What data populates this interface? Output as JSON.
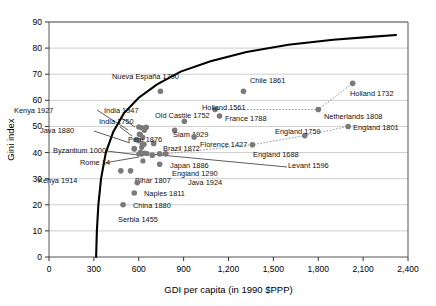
{
  "chart_data": {
    "type": "scatter",
    "title": "",
    "xlabel": "GDI per capita (in 1990 $PPP)",
    "ylabel": "Gini index",
    "xlim": [
      0,
      2400
    ],
    "ylim": [
      0,
      90
    ],
    "xticks": [
      0,
      300,
      600,
      900,
      1200,
      1500,
      1800,
      2100,
      2400
    ],
    "xtick_labels": [
      "0",
      "300",
      "600",
      "900",
      "1,200",
      "1,500",
      "1,800",
      "2,100",
      "2,400"
    ],
    "yticks": [
      0,
      10,
      20,
      30,
      40,
      50,
      60,
      70,
      80,
      90
    ],
    "ytick_labels": [
      "0",
      "10",
      "20",
      "30",
      "40",
      "50",
      "60",
      "70",
      "80",
      "90"
    ],
    "grid": "horizontal",
    "legend": "none",
    "marker_color": "#7a7a7a",
    "curve_color": "#000000",
    "connector_color": "#8a8a8a",
    "points": [
      {
        "name": "Nueva España 1790",
        "x": 745,
        "y": 63.5,
        "lx": 112,
        "ly": 79,
        "anchor": "start"
      },
      {
        "name": "Chile 1861",
        "x": 1300,
        "y": 63.5,
        "lx": 250,
        "ly": 83,
        "anchor": "start"
      },
      {
        "name": "Holland 1732",
        "x": 2030,
        "y": 66.5,
        "lx": 350,
        "ly": 96,
        "anchor": "start"
      },
      {
        "name": "Holland 1561",
        "x": 1110,
        "y": 56.5,
        "lx": 202,
        "ly": 110,
        "anchor": "start"
      },
      {
        "name": "France 1788",
        "x": 1140,
        "y": 54.0,
        "lx": 225,
        "ly": 121,
        "anchor": "start"
      },
      {
        "name": "Netherlands 1808",
        "x": 1800,
        "y": 56.5,
        "lx": 324,
        "ly": 119,
        "anchor": "start"
      },
      {
        "name": "Old Castile 1752",
        "x": 905,
        "y": 52.0,
        "lx": 155,
        "ly": 118,
        "anchor": "start"
      },
      {
        "name": "England 1801",
        "x": 2000,
        "y": 50.0,
        "lx": 353,
        "ly": 130,
        "anchor": "start"
      },
      {
        "name": "England 1759",
        "x": 1710,
        "y": 46.5,
        "lx": 275,
        "ly": 134,
        "anchor": "start"
      },
      {
        "name": "Siam 1929",
        "x": 840,
        "y": 48.5,
        "lx": 173,
        "ly": 137,
        "anchor": "start"
      },
      {
        "name": "Florence 1427",
        "x": 970,
        "y": 46.0,
        "lx": 200,
        "ly": 147,
        "anchor": "start"
      },
      {
        "name": "England 1688",
        "x": 1360,
        "y": 43.0,
        "lx": 253,
        "ly": 157,
        "anchor": "start"
      },
      {
        "name": "Brazil 1872",
        "x": 700,
        "y": 43.5,
        "lx": 163,
        "ly": 151,
        "anchor": "start"
      },
      {
        "name": "Japan 1886",
        "x": 780,
        "y": 39.5,
        "lx": 170,
        "ly": 168,
        "anchor": "start"
      },
      {
        "name": "England 1290",
        "x": 740,
        "y": 39.5,
        "lx": 172,
        "ly": 176,
        "anchor": "start"
      },
      {
        "name": "Levant 1596",
        "x": 690,
        "y": 39.0,
        "lx": 288,
        "ly": 168,
        "anchor": "start"
      },
      {
        "name": "Java 1924",
        "x": 740,
        "y": 35.5,
        "lx": 188,
        "ly": 185,
        "anchor": "start"
      },
      {
        "name": "Bihar 1807",
        "x": 545,
        "y": 33.0,
        "lx": 135,
        "ly": 183,
        "anchor": "start"
      },
      {
        "name": "Kenya 1914",
        "x": 480,
        "y": 33.0,
        "lx": 38,
        "ly": 183,
        "anchor": "start"
      },
      {
        "name": "Naples 1811",
        "x": 590,
        "y": 28.5,
        "lx": 144,
        "ly": 196,
        "anchor": "start"
      },
      {
        "name": "China 1880",
        "x": 570,
        "y": 24.5,
        "lx": 133,
        "ly": 208,
        "anchor": "start"
      },
      {
        "name": "Serbia 1455",
        "x": 495,
        "y": 20.0,
        "lx": 118,
        "ly": 222,
        "anchor": "start"
      },
      {
        "name": "Kenya 1927",
        "x": 620,
        "y": 49.5,
        "lx": 14,
        "ly": 113,
        "anchor": "start"
      },
      {
        "name": "India 1947",
        "x": 650,
        "y": 49.7,
        "lx": 104,
        "ly": 113,
        "anchor": "start"
      },
      {
        "name": "India 1750",
        "x": 605,
        "y": 47.0,
        "lx": 99,
        "ly": 124,
        "anchor": "start"
      },
      {
        "name": "Java 1880",
        "x": 585,
        "y": 45.0,
        "lx": 40,
        "ly": 133,
        "anchor": "start"
      },
      {
        "name": "Peru 1876",
        "x": 625,
        "y": 43.0,
        "lx": 128,
        "ly": 142,
        "anchor": "start"
      },
      {
        "name": "Byzantium 1000",
        "x": 570,
        "y": 41.5,
        "lx": 53,
        "ly": 153,
        "anchor": "start"
      },
      {
        "name": "Rome 14",
        "x": 620,
        "y": 39.5,
        "lx": 80,
        "ly": 165,
        "anchor": "start"
      }
    ],
    "cluster_markers": [
      {
        "x": 600,
        "y": 49.8
      },
      {
        "x": 648,
        "y": 49.6
      },
      {
        "x": 638,
        "y": 48.5
      },
      {
        "x": 612,
        "y": 46.8
      },
      {
        "x": 627,
        "y": 45.8
      },
      {
        "x": 600,
        "y": 44.5
      },
      {
        "x": 636,
        "y": 43.2
      },
      {
        "x": 620,
        "y": 42.0
      },
      {
        "x": 570,
        "y": 41.4
      },
      {
        "x": 612,
        "y": 40.2
      },
      {
        "x": 640,
        "y": 39.8
      },
      {
        "x": 655,
        "y": 39.6
      },
      {
        "x": 600,
        "y": 39.4
      },
      {
        "x": 628,
        "y": 36.8
      }
    ],
    "series_lines": [
      {
        "name": "holland-netherlands-trend",
        "style": "dotted",
        "points": [
          [
            1110,
            56.5
          ],
          [
            1800,
            56.5
          ],
          [
            2030,
            66.5
          ]
        ]
      },
      {
        "name": "england-trend",
        "style": "dotted",
        "points": [
          [
            690,
            39.0
          ],
          [
            1360,
            43.0
          ],
          [
            1710,
            46.5
          ],
          [
            2000,
            50.0
          ]
        ]
      }
    ],
    "frontier_curve": {
      "name": "inequality-possibility-frontier",
      "style": "solid-bold",
      "points": [
        [
          315,
          0
        ],
        [
          320,
          10
        ],
        [
          330,
          20
        ],
        [
          348,
          30
        ],
        [
          380,
          40
        ],
        [
          430,
          48
        ],
        [
          500,
          55
        ],
        [
          600,
          61
        ],
        [
          720,
          66
        ],
        [
          880,
          71
        ],
        [
          1080,
          75
        ],
        [
          1320,
          78.5
        ],
        [
          1600,
          81.3
        ],
        [
          1900,
          83.2
        ],
        [
          2150,
          84.3
        ],
        [
          2320,
          85.0
        ]
      ]
    },
    "leader_lines": [
      {
        "from": [
          97,
          110
        ],
        "to": [
          128,
          130
        ]
      },
      {
        "from": [
          120,
          117
        ],
        "to": [
          135,
          127
        ]
      },
      {
        "from": [
          120,
          127
        ],
        "to": [
          132,
          136
        ]
      },
      {
        "from": [
          94,
          131
        ],
        "to": [
          130,
          143
        ]
      },
      {
        "from": [
          107,
          151
        ],
        "to": [
          138,
          155
        ]
      },
      {
        "from": [
          104,
          163
        ],
        "to": [
          139,
          157
        ]
      },
      {
        "from": [
          287,
          167
        ],
        "to": [
          150,
          154
        ]
      }
    ]
  }
}
